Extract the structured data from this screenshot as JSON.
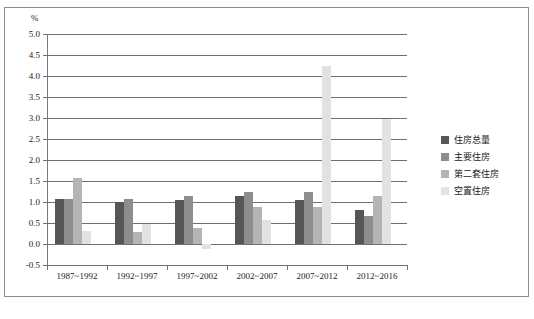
{
  "chart_data": {
    "type": "bar",
    "title": "",
    "unit_label": "%",
    "xlabel": "",
    "ylabel": "",
    "ylim": [
      -0.5,
      5.0
    ],
    "ytick_step": 0.5,
    "grid": true,
    "legend_position": "right",
    "categories": [
      "1987~1992",
      "1992~1997",
      "1997~2002",
      "2002~2007",
      "2007~2012",
      "2012~2016"
    ],
    "ytick_labels": [
      "5.0",
      "4.5",
      "4.0",
      "3.5",
      "3.0",
      "2.5",
      "2.0",
      "1.5",
      "1.0",
      "0.5",
      "0.0",
      "-0.5"
    ],
    "series": [
      {
        "name": "住房总量",
        "color": "#565656",
        "values": [
          1.08,
          0.99,
          1.05,
          1.15,
          1.05,
          0.82
        ]
      },
      {
        "name": "主要住房",
        "color": "#8d8d8d",
        "values": [
          1.08,
          1.06,
          1.15,
          1.25,
          1.25,
          0.66
        ]
      },
      {
        "name": "第二套住房",
        "color": "#b4b4b4",
        "values": [
          1.56,
          0.28,
          0.37,
          0.89,
          0.87,
          1.15
        ]
      },
      {
        "name": "空置住房",
        "color": "#e2e2e2",
        "values": [
          0.3,
          0.47,
          -0.12,
          0.57,
          4.25,
          2.98
        ]
      }
    ]
  },
  "caption": "",
  "figure": {
    "frame_color": "#8e8e8e",
    "axis_color": "#6f6f6f",
    "text_color": "#1a1a1a",
    "background": "#ffffff"
  }
}
